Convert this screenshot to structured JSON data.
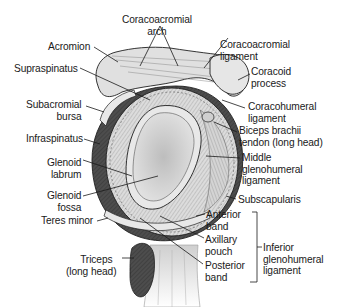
{
  "diagram": {
    "labels": {
      "coracoacromial_arch": [
        "Coracoacromial",
        "arch"
      ],
      "acromion": "Acromion",
      "coracoacromial_ligament": [
        "Coracoacromial",
        "ligament"
      ],
      "supraspinatus": "Supraspinatus",
      "coracoid_process": [
        "Coracoid",
        "process"
      ],
      "subacromial_bursa": [
        "Subacromial",
        "bursa"
      ],
      "coracohumeral_ligament": [
        "Coracohumeral",
        "ligament"
      ],
      "infraspinatus": "Infraspinatus",
      "biceps_brachii_tendon": [
        "Biceps brachii",
        "tendon (long head)"
      ],
      "glenoid_labrum": [
        "Glenoid",
        "labrum"
      ],
      "middle_glenohumeral_ligament": [
        "Middle",
        "glenohumeral",
        "ligament"
      ],
      "glenoid_fossa": [
        "Glenoid",
        "fossa"
      ],
      "subscapularis": "Subscapularis",
      "teres_minor": "Teres minor",
      "anterior_band": [
        "Anterior",
        "band"
      ],
      "axillary_pouch": [
        "Axillary",
        "pouch"
      ],
      "inferior_glenohumeral_ligament": [
        "Inferior",
        "glenohumeral",
        "ligament"
      ],
      "triceps": [
        "Triceps",
        "(long head)"
      ],
      "posterior_band": [
        "Posterior",
        "band"
      ]
    },
    "colors": {
      "muscle_dark": "#4a4a4a",
      "tissue_light": "#d9d9d9",
      "cartilage": "#e6e6e6",
      "outline": "#1f1f1f"
    }
  }
}
